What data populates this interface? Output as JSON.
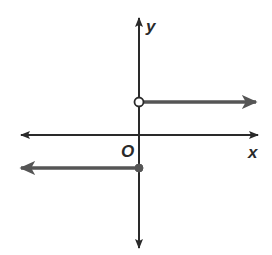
{
  "chart_data": {
    "type": "line",
    "title": "",
    "xlabel": "x",
    "ylabel": "y",
    "origin_label": "O",
    "xlim": [
      -4,
      3
    ],
    "ylim": [
      -3,
      3.5
    ],
    "grid": false,
    "legend": "none",
    "colors": {
      "axis": "#2a2a2a",
      "series": "#555555",
      "open_point_fill": "#ffffff"
    },
    "series": [
      {
        "name": "upper-ray",
        "description": "y = 1 for x > 0",
        "y": 1,
        "x_start": 0,
        "direction": "right",
        "start_point": "open"
      },
      {
        "name": "lower-ray",
        "description": "y = -1 for x <= 0",
        "y": -1,
        "x_start": 0,
        "direction": "left",
        "start_point": "closed"
      }
    ],
    "points": [
      {
        "x": 0,
        "y": 1,
        "style": "open"
      },
      {
        "x": 0,
        "y": -1,
        "style": "closed"
      }
    ]
  }
}
